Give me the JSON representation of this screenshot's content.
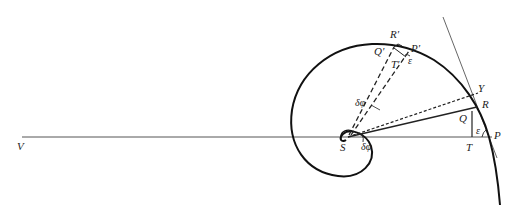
{
  "figure": {
    "colors": {
      "curve": "#111111",
      "lines": "#444444",
      "background": "#ffffff"
    }
  },
  "labels": {
    "V": "V",
    "S": "S",
    "T": "T",
    "P": "P",
    "Q": "Q",
    "R": "R",
    "Y": "Y",
    "eps": "ε",
    "R_prime": "R′",
    "Q_prime": "Q′",
    "P_prime": "P′",
    "T_prime": "T′",
    "eps_prime": "ε",
    "dphi_upper": "δφ",
    "dphi_lower": "δφ"
  }
}
